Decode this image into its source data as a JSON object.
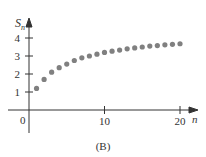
{
  "chart_data": {
    "type": "scatter",
    "title": "",
    "caption": "(B)",
    "xlabel": "n",
    "ylabel": "S_n",
    "ylabel_main": "S",
    "ylabel_sub": "n",
    "x_ticks": [
      10,
      20
    ],
    "x_tick_labels": [
      "10",
      "20"
    ],
    "y_ticks": [
      1,
      2,
      3,
      4
    ],
    "y_tick_labels": [
      "1",
      "2",
      "3",
      "4"
    ],
    "origin_label": "0",
    "xlim": [
      0,
      22
    ],
    "ylim": [
      0,
      4.5
    ],
    "grid": false,
    "legend": null,
    "x": [
      1,
      2,
      3,
      4,
      5,
      6,
      7,
      8,
      9,
      10,
      11,
      12,
      13,
      14,
      15,
      16,
      17,
      18,
      19,
      20
    ],
    "y": [
      1.2,
      1.7,
      2.1,
      2.35,
      2.55,
      2.75,
      2.9,
      3.0,
      3.1,
      3.2,
      3.27,
      3.33,
      3.4,
      3.45,
      3.5,
      3.55,
      3.58,
      3.62,
      3.65,
      3.68
    ],
    "marker_color": "#808080"
  }
}
